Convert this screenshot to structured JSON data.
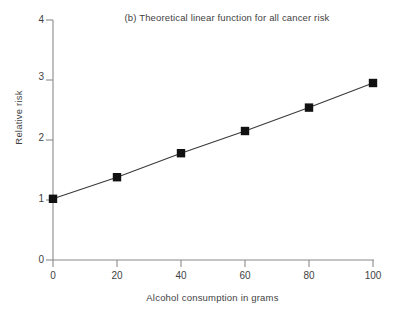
{
  "chart_data": {
    "type": "line",
    "title": "(b) Theoretical linear function for all cancer risk",
    "xlabel": "Alcohol consumption in grams",
    "ylabel": "Relative risk",
    "x": [
      0,
      20,
      40,
      60,
      80,
      100
    ],
    "values": [
      1.02,
      1.38,
      1.78,
      2.15,
      2.54,
      2.95
    ],
    "series": [
      {
        "name": "Theoretical linear function for all cancer risk",
        "values": [
          1.02,
          1.38,
          1.78,
          2.15,
          2.54,
          2.95
        ]
      }
    ],
    "xlim": [
      0,
      100
    ],
    "ylim": [
      0,
      4
    ],
    "xticks": [
      "0",
      "20",
      "40",
      "60",
      "80",
      "100"
    ],
    "yticks": [
      "0",
      "1",
      "2",
      "3",
      "4"
    ],
    "grid": false,
    "legend": "none",
    "marker": "filled-square",
    "marker_color": "#111111",
    "line_color": "#3a3a3a",
    "axis_color": "#8a8a8a",
    "background": "#ffffff"
  }
}
